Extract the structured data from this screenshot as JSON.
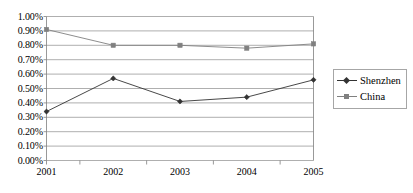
{
  "chart_data": {
    "type": "line",
    "title": "",
    "subtitle": "",
    "xlabel": "",
    "ylabel": "",
    "categories": [
      "2001",
      "2002",
      "2003",
      "2004",
      "2005"
    ],
    "series": [
      {
        "name": "Shenzhen",
        "values": [
          0.0034,
          0.0057,
          0.0041,
          0.0044,
          0.0056
        ],
        "color": "#333333",
        "marker": "diamond"
      },
      {
        "name": "China",
        "values": [
          0.0091,
          0.008,
          0.008,
          0.0078,
          0.0081
        ],
        "color": "#808080",
        "marker": "square"
      }
    ],
    "ylim": [
      0,
      0.01
    ],
    "ytick_values": [
      0,
      0.001,
      0.002,
      0.003,
      0.004,
      0.005,
      0.006,
      0.007,
      0.008,
      0.009,
      0.01
    ],
    "ytick_labels": [
      "0.00%",
      "0.10%",
      "0.20%",
      "0.30%",
      "0.40%",
      "0.50%",
      "0.60%",
      "0.70%",
      "0.80%",
      "0.90%",
      "1.00%"
    ],
    "grid": "horizontal",
    "legend_position": "right",
    "legend_entries": [
      "Shenzhen",
      "China"
    ],
    "annotations": []
  },
  "style": {
    "grid_color": "#9a9a9a",
    "axis_color": "#7f7f7f",
    "plot_background": "#ffffff",
    "legend_border": "#a6a6a6"
  }
}
